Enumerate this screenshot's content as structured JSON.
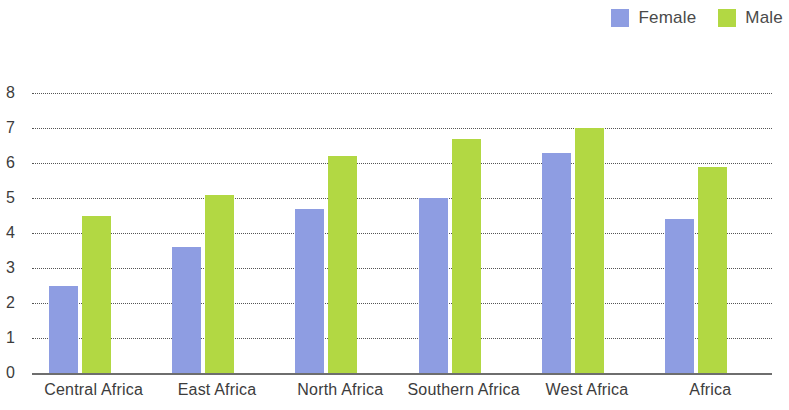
{
  "chart_data": {
    "type": "bar",
    "title": "",
    "subtitle": "",
    "xlabel": "",
    "ylabel": "",
    "ylim": [
      0,
      8
    ],
    "ytick_labels": [
      "0",
      "1",
      "2",
      "3",
      "4",
      "5",
      "6",
      "7",
      "8"
    ],
    "ytick_values": [
      0,
      1,
      2,
      3,
      4,
      5,
      6,
      7,
      8
    ],
    "grid": true,
    "grid_axis": "y",
    "legend_position": "top-right",
    "categories": [
      "Central Africa",
      "East Africa",
      "North Africa",
      "Southern Africa",
      "West Africa",
      "Africa"
    ],
    "series": [
      {
        "name": "Female",
        "color": "#8e9de2",
        "values": [
          2.5,
          3.6,
          4.7,
          5.0,
          6.3,
          4.4
        ]
      },
      {
        "name": "Male",
        "color": "#b2d843",
        "values": [
          4.5,
          5.1,
          6.2,
          6.7,
          7.0,
          5.9
        ]
      }
    ]
  },
  "legend": {
    "items": [
      {
        "label": "Female",
        "color": "#8e9de2"
      },
      {
        "label": "Male",
        "color": "#b2d843"
      }
    ]
  },
  "colors": {
    "female": "#8e9de2",
    "male": "#b2d843",
    "gridline": "#555555",
    "axis": "#6e6e6e",
    "text": "#3c3c3c",
    "background": "#ffffff"
  }
}
